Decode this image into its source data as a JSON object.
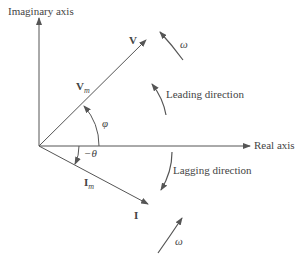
{
  "axes": {
    "imaginary_label": "Imaginary axis",
    "real_label": "Real axis"
  },
  "phasors": {
    "voltage_label": "V",
    "voltage_magnitude_label": "V",
    "voltage_magnitude_sub": "m",
    "current_label": "I",
    "current_magnitude_label": "I",
    "current_magnitude_sub": "m"
  },
  "angles": {
    "phi": "φ",
    "theta": "−θ"
  },
  "rotation": {
    "omega_top": "ω",
    "omega_bottom": "ω",
    "leading": "Leading direction",
    "lagging": "Lagging direction"
  },
  "colors": {
    "line": "#555555",
    "text": "#444444"
  }
}
